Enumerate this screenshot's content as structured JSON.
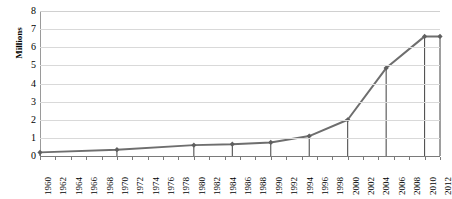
{
  "chart_data": {
    "type": "line",
    "title": "",
    "xlabel": "",
    "ylabel": "Millions",
    "ylim": [
      0,
      8
    ],
    "ytick_step": 1,
    "ytick_labels": [
      "8",
      "7",
      "6",
      "5",
      "4",
      "3",
      "2",
      "1",
      "0"
    ],
    "xlim": [
      1960,
      2012
    ],
    "xtick_step": 2,
    "xtick_labels": [
      "1960",
      "1962",
      "1964",
      "1966",
      "1968",
      "1970",
      "1972",
      "1974",
      "1976",
      "1978",
      "1980",
      "1982",
      "1984",
      "1986",
      "1988",
      "1990",
      "1992",
      "1994",
      "1996",
      "1998",
      "2000",
      "2002",
      "2004",
      "2006",
      "2008",
      "2010",
      "2012"
    ],
    "grid": true,
    "grid_axis": "y",
    "legend": false,
    "marker": "diamond",
    "drop_lines": true,
    "series": [
      {
        "name": "Millions",
        "color": "#6e6e6e",
        "x": [
          1960,
          1970,
          1980,
          1985,
          1990,
          1995,
          2000,
          2005,
          2010,
          2012
        ],
        "values": [
          0.2,
          0.35,
          0.6,
          0.65,
          0.75,
          1.1,
          2.0,
          4.85,
          6.6,
          6.6
        ]
      }
    ]
  },
  "style": {
    "line_color": "#6e6e6e",
    "marker_color": "#5f5f5f",
    "grid_color": "#d9d9d9",
    "axis_color": "#7a7a7a",
    "drop_line_color": "#3f3f3f",
    "background": "#ffffff",
    "text_color": "#000000"
  }
}
